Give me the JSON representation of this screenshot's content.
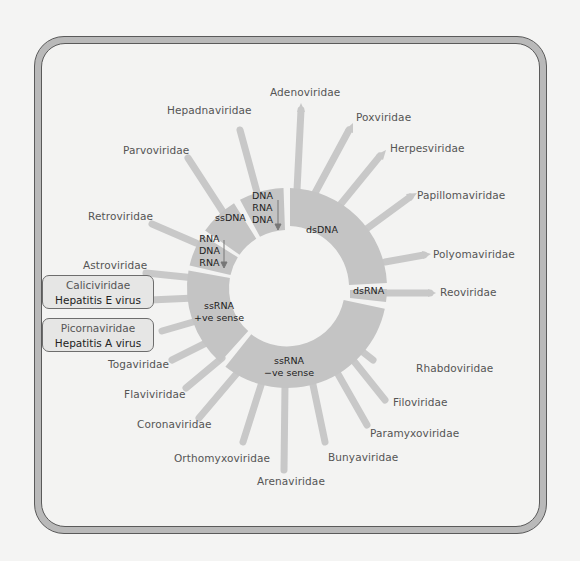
{
  "diagram": {
    "segments": [
      {
        "id": "dsDNA",
        "label": "dsDNA"
      },
      {
        "id": "dsRNA",
        "label": "dsRNA"
      },
      {
        "id": "ssRNA_neg",
        "label_line1": "ssRNA",
        "label_line2": "−ve sense"
      },
      {
        "id": "ssRNA_pos",
        "label_line1": "ssRNA",
        "label_line2": "+ve sense"
      },
      {
        "id": "rna_dna_rna",
        "label_line1": "RNA",
        "label_line2": "DNA",
        "label_line3": "RNA"
      },
      {
        "id": "ssDNA",
        "label": "ssDNA"
      },
      {
        "id": "dna_rna_dna",
        "label_line1": "DNA",
        "label_line2": "RNA",
        "label_line3": "DNA"
      }
    ],
    "families": {
      "adenoviridae": "Adenoviridae",
      "poxviridae": "Poxviridae",
      "herpesviridae": "Herpesviridae",
      "papillomaviridae": "Papillomaviridae",
      "polyomaviridae": "Polyomaviridae",
      "reoviridae": "Reoviridae",
      "rhabdoviridae": "Rhabdoviridae",
      "filoviridae": "Filoviridae",
      "paramyxoviridae": "Paramyxoviridae",
      "bunyaviridae": "Bunyaviridae",
      "arenaviridae": "Arenaviridae",
      "orthomyxoviridae": "Orthomyxoviridae",
      "coronaviridae": "Coronaviridae",
      "flaviviridae": "Flaviviridae",
      "togaviridae": "Togaviridae",
      "astroviridae": "Astroviridae",
      "retroviridae": "Retroviridae",
      "parvoviridae": "Parvoviridae",
      "hepadnaviridae": "Hepadnaviridae"
    },
    "highlight_boxes": [
      {
        "family": "Caliciviridae",
        "virus": "Hepatitis E virus"
      },
      {
        "family": "Picornaviridae",
        "virus": "Hepatitis A virus"
      }
    ],
    "colors": {
      "ring": "#c4c4c4",
      "spoke": "#c8c8c8",
      "frame": "#b9b9b9",
      "background": "#f3f3f2"
    }
  }
}
